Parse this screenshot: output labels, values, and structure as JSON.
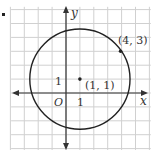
{
  "figure": {
    "type": "coordinate-plane-circle",
    "grid": {
      "x_range": [
        -4,
        6
      ],
      "y_range": [
        -4,
        6
      ],
      "unit_px": 13.9,
      "color": "#d0d0d0"
    },
    "axes": {
      "x_label": "x",
      "y_label": "y",
      "origin_label": "O",
      "x_tick_label": "1",
      "y_tick_label": "1",
      "color": "#333333"
    },
    "circle": {
      "center": [
        1,
        1
      ],
      "radius": 3.606,
      "color": "#222222"
    },
    "points": [
      {
        "id": "center",
        "coords": [
          1,
          1
        ],
        "label": "(1, 1)"
      },
      {
        "id": "on-circle",
        "coords": [
          4,
          3
        ],
        "label": "(4, 3)"
      }
    ]
  }
}
